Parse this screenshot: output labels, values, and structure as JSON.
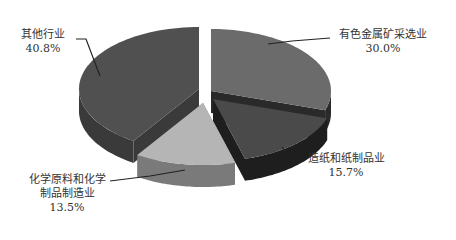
{
  "chart_data": {
    "type": "pie",
    "style": "3d-exploded",
    "title": "",
    "categories": [
      "有色金属矿采选业",
      "造纸和纸制品业",
      "化学原料和化学制品制造业",
      "其他行业"
    ],
    "values": [
      30.0,
      15.7,
      13.5,
      40.8
    ],
    "unit": "%",
    "colors": [
      "#6b6b6b",
      "#4a4a4a",
      "#b5b5b5",
      "#505050"
    ],
    "side_colors": [
      "#2a2a2a",
      "#1e1e1e",
      "#7a7a7a",
      "#3a3a3a"
    ],
    "legend": "none",
    "data_labels": [
      {
        "name_lines": [
          "有色金属矿采选业"
        ],
        "value": "30.0%"
      },
      {
        "name_lines": [
          "造纸和纸制品业"
        ],
        "value": "15.7%"
      },
      {
        "name_lines": [
          "化学原料和化学",
          "制品制造业"
        ],
        "value": "13.5%"
      },
      {
        "name_lines": [
          "其他行业"
        ],
        "value": "40.8%"
      }
    ]
  },
  "labels": {
    "s0_name": "有色金属矿采选业",
    "s0_value": "30.0%",
    "s1_name": "造纸和纸制品业",
    "s1_value": "15.7%",
    "s2_name_1": "化学原料和化学",
    "s2_name_2": "制品制造业",
    "s2_value": "13.5%",
    "s3_name": "其他行业",
    "s3_value": "40.8%"
  }
}
